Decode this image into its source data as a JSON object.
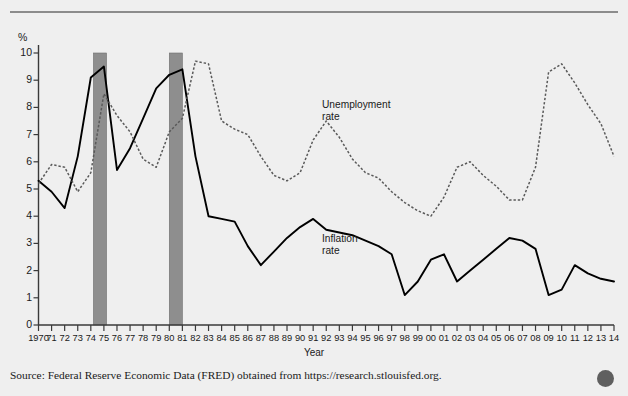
{
  "figure": {
    "background_color": "#efefef",
    "source_note": "Source: Federal Reserve Economic Data (FRED) obtained from https://research.stlouisfed.org.",
    "corner_dot_color": "#5f5f5f"
  },
  "chart_data": {
    "type": "line",
    "title": "",
    "subtitle": "",
    "xlabel": "Year",
    "ylabel": "%",
    "yunit_symbol": "%",
    "grid": false,
    "legend_position": "inline-annotation",
    "xlim": [
      1970,
      2014
    ],
    "ylim": [
      0,
      10
    ],
    "yticks": [
      0,
      1,
      2,
      3,
      4,
      5,
      6,
      7,
      8,
      9,
      10
    ],
    "ytick_labels": [
      "0",
      "1",
      "2",
      "3",
      "4",
      "5",
      "6",
      "7",
      "8",
      "9",
      "10"
    ],
    "x": [
      1970,
      1971,
      1972,
      1973,
      1974,
      1975,
      1976,
      1977,
      1978,
      1979,
      1980,
      1981,
      1982,
      1983,
      1984,
      1985,
      1986,
      1987,
      1988,
      1989,
      1990,
      1991,
      1992,
      1993,
      1994,
      1995,
      1996,
      1997,
      1998,
      1999,
      2000,
      2001,
      2002,
      2003,
      2004,
      2005,
      2006,
      2007,
      2008,
      2009,
      2010,
      2011,
      2012,
      2013,
      2014
    ],
    "xtick_labels": [
      "1970",
      "71",
      "72",
      "73",
      "74",
      "75",
      "76",
      "77",
      "78",
      "79",
      "80",
      "81",
      "82",
      "83",
      "84",
      "85",
      "86",
      "87",
      "88",
      "89",
      "90",
      "91",
      "92",
      "93",
      "94",
      "95",
      "96",
      "97",
      "98",
      "99",
      "00",
      "01",
      "02",
      "03",
      "04",
      "05",
      "06",
      "07",
      "08",
      "09",
      "10",
      "11",
      "12",
      "13",
      "14"
    ],
    "series": [
      {
        "name": "Inflation rate",
        "style": "solid",
        "color": "#000000",
        "label_text": "Inflation\nrate",
        "values": [
          5.3,
          4.9,
          4.3,
          6.2,
          9.1,
          9.5,
          5.7,
          6.5,
          7.6,
          8.7,
          9.2,
          9.4,
          6.2,
          4.0,
          3.9,
          3.8,
          2.9,
          2.2,
          2.7,
          3.2,
          3.6,
          3.9,
          3.5,
          3.4,
          3.3,
          3.1,
          2.9,
          2.6,
          1.1,
          1.6,
          2.4,
          2.6,
          1.6,
          2.0,
          2.4,
          2.8,
          3.2,
          3.1,
          2.8,
          1.1,
          1.3,
          2.2,
          1.9,
          1.7,
          1.6
        ]
      },
      {
        "name": "Unemployment rate",
        "style": "dashed",
        "color": "#5a5a5a",
        "label_text": "Unemployment\nrate",
        "values": [
          5.2,
          5.9,
          5.8,
          4.9,
          5.6,
          8.5,
          7.7,
          7.1,
          6.1,
          5.8,
          7.1,
          7.6,
          9.7,
          9.6,
          7.5,
          7.2,
          7.0,
          6.2,
          5.5,
          5.3,
          5.6,
          6.8,
          7.5,
          6.9,
          6.1,
          5.6,
          5.4,
          4.9,
          4.5,
          4.2,
          4.0,
          4.7,
          5.8,
          6.0,
          5.5,
          5.1,
          4.6,
          4.6,
          5.8,
          9.3,
          9.6,
          8.9,
          8.1,
          7.4,
          6.2
        ]
      }
    ],
    "recession_bars": [
      {
        "label": "1974-75 recession",
        "start": 1974.2,
        "end": 1975.2,
        "color": "#8e8e8e"
      },
      {
        "label": "1980-81 recession",
        "start": 1980.0,
        "end": 1981.0,
        "color": "#8e8e8e"
      }
    ]
  }
}
